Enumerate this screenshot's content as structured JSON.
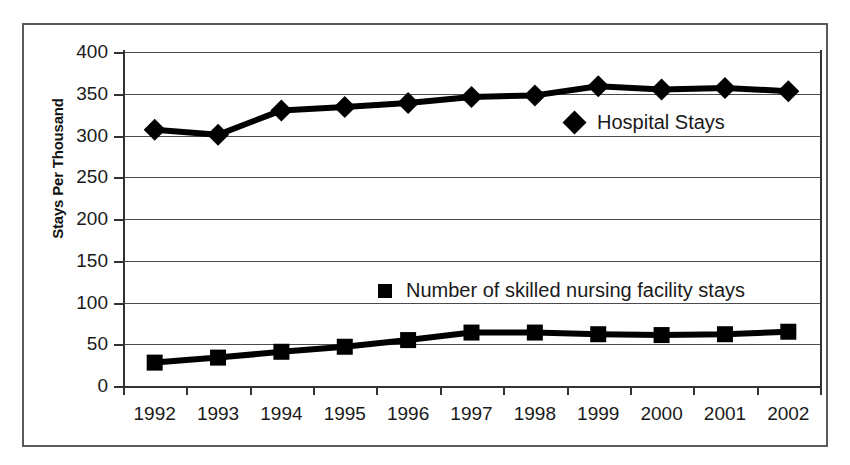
{
  "chart_data": {
    "type": "line",
    "title": "",
    "subtitle": "",
    "xlabel": "",
    "ylabel": "Stays Per Thousand",
    "categories": [
      "1992",
      "1993",
      "1994",
      "1995",
      "1996",
      "1997",
      "1998",
      "1999",
      "2000",
      "2001",
      "2002"
    ],
    "ylim": [
      0,
      400
    ],
    "ytick_values": [
      0,
      50,
      100,
      150,
      200,
      250,
      300,
      350,
      400
    ],
    "ytick_labels": [
      "0",
      "50",
      "100",
      "150",
      "200",
      "250",
      "300",
      "350",
      "400"
    ],
    "grid": true,
    "legend_position": "inside-plot",
    "series": [
      {
        "name": "Hospital Stays",
        "marker": "diamond",
        "color": "#000000",
        "values": [
          307,
          301,
          330,
          334,
          339,
          346,
          348,
          359,
          355,
          357,
          353
        ]
      },
      {
        "name": "Number of skilled nursing facility stays",
        "marker": "square",
        "color": "#000000",
        "values": [
          28,
          34,
          41,
          47,
          55,
          64,
          64,
          62,
          61,
          62,
          65
        ]
      }
    ]
  },
  "legend": {
    "hospital": {
      "label": "Hospital Stays",
      "marker_icon": "diamond-marker-icon"
    },
    "snf": {
      "label": "Number of skilled nursing facility stays",
      "marker_icon": "square-marker-icon"
    }
  },
  "axes": {
    "y_title": "Stays Per Thousand"
  }
}
